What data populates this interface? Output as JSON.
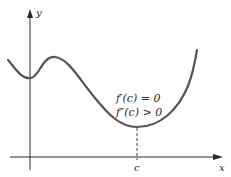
{
  "figure": {
    "axes": {
      "x_label": "x",
      "y_label": "y"
    },
    "point": {
      "label": "c"
    },
    "conditions": [
      "f′(c) = 0",
      "f″(c) > 0"
    ],
    "colors": {
      "curve": "#555555",
      "axes": "#2a2a2a",
      "text": "#2a2a2a",
      "background": "#ffffff"
    }
  }
}
